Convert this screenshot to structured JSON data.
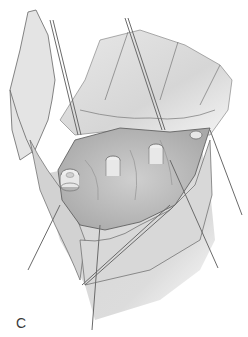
{
  "figure": {
    "panel_label": "C",
    "colors": {
      "skin": "#e2e2e2",
      "skin_shadow": "#c8c8c8",
      "wound": "#bdbdbd",
      "outline": "#555555",
      "wire": "#6a6a6a",
      "tendon": "#ededed"
    }
  }
}
